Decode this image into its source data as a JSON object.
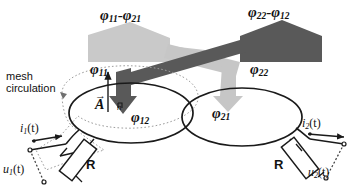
{
  "figure": {
    "title_alt": "Mutual inductance flux linkage diagram",
    "labels": {
      "flux_left_top": {
        "sym": "φ",
        "sub1": "11",
        "op": "-",
        "sym2": "φ",
        "sub2": "21"
      },
      "flux_right_top": {
        "sym": "φ",
        "sub1": "22",
        "op": "-",
        "sym2": "φ",
        "sub2": "12"
      },
      "flux_11": {
        "sym": "φ",
        "sub": "11"
      },
      "flux_22": {
        "sym": "φ",
        "sub": "22"
      },
      "flux_12": {
        "sym": "φ",
        "sub": "12"
      },
      "flux_21": {
        "sym": "φ",
        "sub": "21"
      },
      "mesh_line1": "mesh",
      "mesh_line2": "circulation",
      "area_vector": "A",
      "normal_vector": "n",
      "resistor_left": "R",
      "resistor_right": "R",
      "current_left": {
        "sym": "i",
        "sub": "1",
        "arg": "(t)"
      },
      "current_right": {
        "sym": "i",
        "sub": "2",
        "arg": "(t)"
      },
      "voltage_left": {
        "sym": "u",
        "sub": "1",
        "arg": "(t)"
      },
      "voltage_right": {
        "sym": "u",
        "sub": "2",
        "arg": "(t)"
      }
    },
    "colors": {
      "flux_light": "#c6c6c6",
      "flux_dark": "#595959",
      "flux_mid": "#b5b5b5",
      "loop_stroke": "#1a1a1a",
      "mesh_dotted": "#9a9a9a",
      "text": "#111111",
      "background": "#ffffff"
    }
  }
}
